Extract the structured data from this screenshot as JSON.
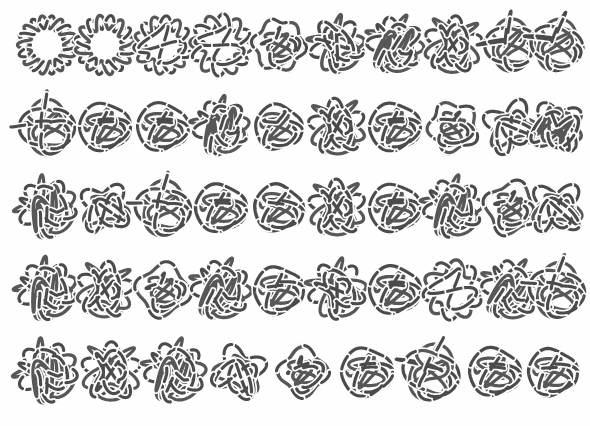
{
  "figure": {
    "kind": "knot-diagram-table",
    "background_color": "#fefefe",
    "stroke_color": "#4b4b4b",
    "break_color": "#fdfdfd",
    "stroke_width": 3.1,
    "break_width": 6.4,
    "canvas": {
      "width": 590,
      "height": 426
    },
    "grid": {
      "rows": 5,
      "columns": 10,
      "total_knots": 49,
      "row_centers_y": [
        45,
        127,
        208,
        290,
        372
      ],
      "column_centers_x": [
        47,
        105,
        163,
        221,
        279,
        337,
        395,
        453,
        511,
        555
      ],
      "row_counts": [
        10,
        10,
        10,
        10,
        9
      ],
      "cell_size": 62
    },
    "knots": [
      {
        "row": 1,
        "col": 1,
        "cx": 47,
        "cy": 45,
        "style": "ring-braid",
        "lobes": 9,
        "radius": 23,
        "amp": 6.5,
        "rot": 0,
        "scale": 1.0
      },
      {
        "row": 1,
        "col": 2,
        "cx": 105,
        "cy": 45,
        "style": "ring-braid",
        "lobes": 8,
        "radius": 23,
        "amp": 7.0,
        "rot": 12,
        "scale": 1.0
      },
      {
        "row": 1,
        "col": 3,
        "cx": 163,
        "cy": 45,
        "style": "ring-chord",
        "lobes": 7,
        "radius": 23,
        "amp": 7.0,
        "rot": 20,
        "scale": 1.0
      },
      {
        "row": 1,
        "col": 4,
        "cx": 221,
        "cy": 45,
        "style": "ring-chord",
        "lobes": 6,
        "radius": 24,
        "amp": 8.0,
        "rot": 35,
        "scale": 1.0
      },
      {
        "row": 1,
        "col": 5,
        "cx": 279,
        "cy": 45,
        "style": "ring-disc",
        "lobes": 6,
        "radius": 25,
        "amp": 5.0,
        "rot": 8,
        "scale": 1.0
      },
      {
        "row": 1,
        "col": 6,
        "cx": 337,
        "cy": 45,
        "style": "rosette",
        "lobes": 5,
        "radius": 23,
        "amp": 8.0,
        "rot": 18,
        "scale": 1.0
      },
      {
        "row": 1,
        "col": 7,
        "cx": 395,
        "cy": 45,
        "style": "rosette-dense",
        "lobes": 5,
        "radius": 23,
        "amp": 8.5,
        "rot": 40,
        "scale": 1.0
      },
      {
        "row": 1,
        "col": 8,
        "cx": 453,
        "cy": 45,
        "style": "rosette",
        "lobes": 5,
        "radius": 24,
        "amp": 9.0,
        "rot": 60,
        "scale": 1.0
      },
      {
        "row": 1,
        "col": 9,
        "cx": 511,
        "cy": 45,
        "style": "lattice",
        "lobes": 4,
        "radius": 23,
        "amp": 8.0,
        "rot": 0,
        "scale": 1.0
      },
      {
        "row": 1,
        "col": 10,
        "cx": 557,
        "cy": 45,
        "style": "lattice",
        "lobes": 4,
        "radius": 23,
        "amp": 8.0,
        "rot": 15,
        "scale": 1.0
      },
      {
        "row": 2,
        "col": 1,
        "cx": 47,
        "cy": 127,
        "style": "lattice",
        "lobes": 4,
        "radius": 24,
        "amp": 9.0,
        "rot": 0,
        "scale": 1.0
      },
      {
        "row": 2,
        "col": 2,
        "cx": 105,
        "cy": 127,
        "style": "pretzel-row",
        "lobes": 4,
        "radius": 25,
        "amp": 6.0,
        "rot": 0,
        "scale": 1.0
      },
      {
        "row": 2,
        "col": 3,
        "cx": 163,
        "cy": 127,
        "style": "pretzel-row",
        "lobes": 3,
        "radius": 25,
        "amp": 6.5,
        "rot": 6,
        "scale": 1.0
      },
      {
        "row": 2,
        "col": 4,
        "cx": 221,
        "cy": 127,
        "style": "rosette-dense",
        "lobes": 5,
        "radius": 23,
        "amp": 8.0,
        "rot": 25,
        "scale": 1.0
      },
      {
        "row": 2,
        "col": 5,
        "cx": 279,
        "cy": 127,
        "style": "pretzel-row",
        "lobes": 3,
        "radius": 23,
        "amp": 7.0,
        "rot": 12,
        "scale": 1.0
      },
      {
        "row": 2,
        "col": 6,
        "cx": 337,
        "cy": 127,
        "style": "rosette",
        "lobes": 5,
        "radius": 24,
        "amp": 8.5,
        "rot": 48,
        "scale": 1.0
      },
      {
        "row": 2,
        "col": 7,
        "cx": 395,
        "cy": 127,
        "style": "pretzel-row",
        "lobes": 4,
        "radius": 25,
        "amp": 6.5,
        "rot": 0,
        "scale": 1.0
      },
      {
        "row": 2,
        "col": 8,
        "cx": 453,
        "cy": 127,
        "style": "ring-disc",
        "lobes": 5,
        "radius": 24,
        "amp": 6.0,
        "rot": 30,
        "scale": 1.0
      },
      {
        "row": 2,
        "col": 9,
        "cx": 511,
        "cy": 127,
        "style": "rosette",
        "lobes": 4,
        "radius": 24,
        "amp": 9.0,
        "rot": 22,
        "scale": 1.0
      },
      {
        "row": 2,
        "col": 10,
        "cx": 557,
        "cy": 127,
        "style": "rosette-dense",
        "lobes": 4,
        "radius": 23,
        "amp": 8.5,
        "rot": 55,
        "scale": 1.0
      },
      {
        "row": 3,
        "col": 1,
        "cx": 47,
        "cy": 208,
        "style": "rosette-dense",
        "lobes": 5,
        "radius": 24,
        "amp": 9.0,
        "rot": 10,
        "scale": 1.0
      },
      {
        "row": 3,
        "col": 2,
        "cx": 105,
        "cy": 208,
        "style": "rosette",
        "lobes": 4,
        "radius": 23,
        "amp": 8.0,
        "rot": 35,
        "scale": 1.0
      },
      {
        "row": 3,
        "col": 3,
        "cx": 163,
        "cy": 208,
        "style": "lattice",
        "lobes": 4,
        "radius": 24,
        "amp": 9.0,
        "rot": 8,
        "scale": 1.0
      },
      {
        "row": 3,
        "col": 4,
        "cx": 221,
        "cy": 208,
        "style": "pretzel-row",
        "lobes": 4,
        "radius": 25,
        "amp": 6.5,
        "rot": 4,
        "scale": 1.0
      },
      {
        "row": 3,
        "col": 5,
        "cx": 279,
        "cy": 208,
        "style": "pretzel-row",
        "lobes": 3,
        "radius": 24,
        "amp": 7.5,
        "rot": 14,
        "scale": 1.0
      },
      {
        "row": 3,
        "col": 6,
        "cx": 337,
        "cy": 208,
        "style": "rosette",
        "lobes": 5,
        "radius": 24,
        "amp": 8.5,
        "rot": 52,
        "scale": 1.0
      },
      {
        "row": 3,
        "col": 7,
        "cx": 395,
        "cy": 208,
        "style": "pretzel-row",
        "lobes": 4,
        "radius": 25,
        "amp": 6.0,
        "rot": 0,
        "scale": 1.0
      },
      {
        "row": 3,
        "col": 8,
        "cx": 453,
        "cy": 208,
        "style": "rosette-dense",
        "lobes": 5,
        "radius": 24,
        "amp": 9.0,
        "rot": 28,
        "scale": 1.0
      },
      {
        "row": 3,
        "col": 9,
        "cx": 511,
        "cy": 208,
        "style": "ring-disc",
        "lobes": 4,
        "radius": 25,
        "amp": 7.0,
        "rot": 18,
        "scale": 1.0
      },
      {
        "row": 3,
        "col": 10,
        "cx": 557,
        "cy": 208,
        "style": "rosette",
        "lobes": 4,
        "radius": 24,
        "amp": 9.0,
        "rot": 42,
        "scale": 1.0
      },
      {
        "row": 4,
        "col": 1,
        "cx": 47,
        "cy": 290,
        "style": "rosette-dense",
        "lobes": 5,
        "radius": 24,
        "amp": 9.0,
        "rot": 16,
        "scale": 1.0
      },
      {
        "row": 4,
        "col": 2,
        "cx": 105,
        "cy": 290,
        "style": "rosette",
        "lobes": 5,
        "radius": 24,
        "amp": 8.5,
        "rot": 62,
        "scale": 1.0
      },
      {
        "row": 4,
        "col": 3,
        "cx": 163,
        "cy": 290,
        "style": "ring-disc",
        "lobes": 4,
        "radius": 25,
        "amp": 6.5,
        "rot": 10,
        "scale": 1.0
      },
      {
        "row": 4,
        "col": 4,
        "cx": 221,
        "cy": 290,
        "style": "rosette-dense",
        "lobes": 5,
        "radius": 24,
        "amp": 9.0,
        "rot": 38,
        "scale": 1.0
      },
      {
        "row": 4,
        "col": 5,
        "cx": 279,
        "cy": 290,
        "style": "pretzel-row",
        "lobes": 3,
        "radius": 24,
        "amp": 7.5,
        "rot": 0,
        "scale": 1.0
      },
      {
        "row": 4,
        "col": 6,
        "cx": 337,
        "cy": 290,
        "style": "rosette",
        "lobes": 5,
        "radius": 24,
        "amp": 9.0,
        "rot": 20,
        "scale": 1.0
      },
      {
        "row": 4,
        "col": 7,
        "cx": 395,
        "cy": 290,
        "style": "pretzel-row",
        "lobes": 4,
        "radius": 25,
        "amp": 6.5,
        "rot": 6,
        "scale": 1.0
      },
      {
        "row": 4,
        "col": 8,
        "cx": 453,
        "cy": 290,
        "style": "ring-chord",
        "lobes": 5,
        "radius": 24,
        "amp": 7.0,
        "rot": 25,
        "scale": 1.0
      },
      {
        "row": 4,
        "col": 9,
        "cx": 511,
        "cy": 290,
        "style": "rosette-dense",
        "lobes": 5,
        "radius": 24,
        "amp": 9.0,
        "rot": 45,
        "scale": 1.0
      },
      {
        "row": 4,
        "col": 10,
        "cx": 557,
        "cy": 290,
        "style": "lattice",
        "lobes": 4,
        "radius": 24,
        "amp": 9.0,
        "rot": 12,
        "scale": 1.0
      },
      {
        "row": 5,
        "col": 1,
        "cx": 47,
        "cy": 372,
        "style": "rosette-dense",
        "lobes": 5,
        "radius": 25,
        "amp": 9.0,
        "rot": 8,
        "scale": 1.0
      },
      {
        "row": 5,
        "col": 2,
        "cx": 111,
        "cy": 372,
        "style": "rosette",
        "lobes": 5,
        "radius": 25,
        "amp": 9.0,
        "rot": 55,
        "scale": 1.0
      },
      {
        "row": 5,
        "col": 3,
        "cx": 175,
        "cy": 372,
        "style": "rosette-dense",
        "lobes": 5,
        "radius": 25,
        "amp": 9.0,
        "rot": 30,
        "scale": 1.0
      },
      {
        "row": 5,
        "col": 4,
        "cx": 239,
        "cy": 372,
        "style": "rosette",
        "lobes": 4,
        "radius": 24,
        "amp": 8.5,
        "rot": 70,
        "scale": 1.0
      },
      {
        "row": 5,
        "col": 5,
        "cx": 303,
        "cy": 372,
        "style": "ring-disc",
        "lobes": 4,
        "radius": 23,
        "amp": 6.5,
        "rot": 0,
        "scale": 1.0
      },
      {
        "row": 5,
        "col": 6,
        "cx": 367,
        "cy": 372,
        "style": "pretzel-row",
        "lobes": 3,
        "radius": 25,
        "amp": 7.5,
        "rot": 0,
        "scale": 1.0
      },
      {
        "row": 5,
        "col": 7,
        "cx": 431,
        "cy": 372,
        "style": "lattice",
        "lobes": 4,
        "radius": 25,
        "amp": 9.0,
        "rot": 20,
        "scale": 1.0
      },
      {
        "row": 5,
        "col": 8,
        "cx": 495,
        "cy": 372,
        "style": "pretzel-row",
        "lobes": 4,
        "radius": 25,
        "amp": 7.0,
        "rot": 8,
        "scale": 1.0
      },
      {
        "row": 5,
        "col": 9,
        "cx": 553,
        "cy": 372,
        "style": "pretzel-row",
        "lobes": 3,
        "radius": 24,
        "amp": 7.5,
        "rot": 4,
        "scale": 1.0
      }
    ]
  }
}
